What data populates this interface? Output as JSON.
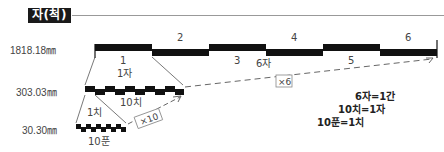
{
  "title": "자(척)",
  "dimensions": {
    "gan": "1818.18㎜",
    "ja": "303.03㎜",
    "chi": "30.30㎜"
  },
  "gan_bar": {
    "segment_labels": [
      "1",
      "2",
      "3",
      "4",
      "5",
      "6"
    ],
    "caption": "6자"
  },
  "ja_bar": {
    "top_caption": "1자",
    "bottom_caption": "10치"
  },
  "chi_bar": {
    "top_caption": "1치",
    "bottom_caption": "10푼"
  },
  "multipliers": {
    "x6": "×6",
    "x10": "×10"
  },
  "equations": [
    "6자=1간",
    "10치=1자",
    "10푼=1치"
  ],
  "colors": {
    "bar": "#111111",
    "line": "#555555",
    "title_bg": "#1a1a1a"
  }
}
